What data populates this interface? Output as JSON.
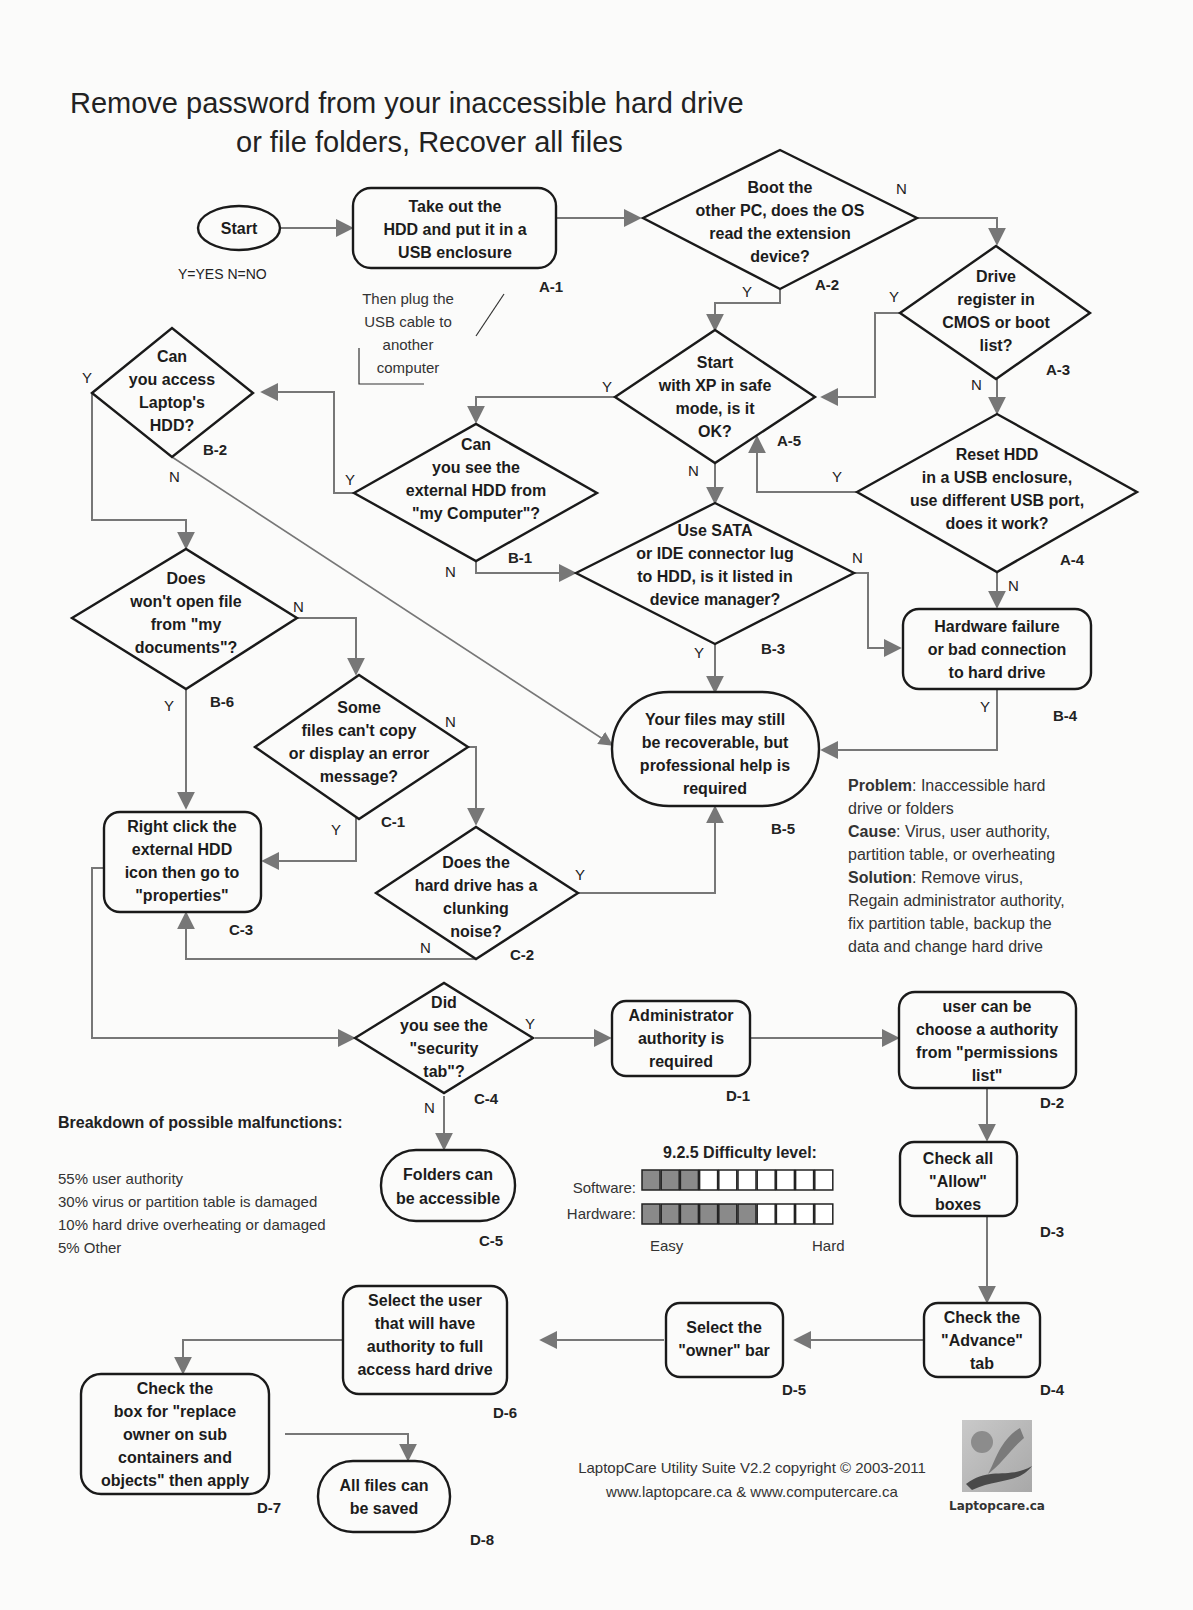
{
  "title": {
    "line1": "Remove password from your inaccessible hard drive",
    "line2": "or file folders, Recover all files"
  },
  "legend": {
    "yes_no": "Y=YES N=NO"
  },
  "nodes": {
    "start": {
      "id": "",
      "lines": [
        "Start"
      ]
    },
    "A1": {
      "id": "A-1",
      "lines": [
        "Take out the",
        "HDD and put it in a",
        "USB enclosure"
      ]
    },
    "A1_note": {
      "lines": [
        "Then plug the",
        "USB cable to",
        "another",
        "computer"
      ]
    },
    "A2": {
      "id": "A-2",
      "lines": [
        "Boot the",
        "other PC, does the OS",
        "read the extension",
        "device?"
      ]
    },
    "A3": {
      "id": "A-3",
      "lines": [
        "Drive",
        "register in",
        "CMOS or boot",
        "list?"
      ]
    },
    "A4": {
      "id": "A-4",
      "lines": [
        "Reset HDD",
        "in a USB enclosure,",
        "use different USB port,",
        "does it work?"
      ]
    },
    "A5": {
      "id": "A-5",
      "lines": [
        "Start",
        "with XP in safe",
        "mode, is it",
        "OK?"
      ]
    },
    "B1": {
      "id": "B-1",
      "lines": [
        "Can",
        "you see the",
        "external HDD from",
        "\"my Computer\"?"
      ]
    },
    "B2": {
      "id": "B-2",
      "lines": [
        "Can",
        "you access",
        "Laptop's",
        "HDD?"
      ]
    },
    "B3": {
      "id": "B-3",
      "lines": [
        "Use SATA",
        "or IDE connector lug",
        "to HDD, is it listed in",
        "device manager?"
      ]
    },
    "B4": {
      "id": "B-4",
      "lines": [
        "Hardware failure",
        "or bad connection",
        "to hard drive"
      ]
    },
    "B5": {
      "id": "B-5",
      "lines": [
        "Your files may still",
        "be recoverable, but",
        "professional help is",
        "required"
      ]
    },
    "B6": {
      "id": "B-6",
      "lines": [
        "Does",
        "won't open file",
        "from \"my",
        "documents\"?"
      ]
    },
    "C1": {
      "id": "C-1",
      "lines": [
        "Some",
        "files can't copy",
        "or display an error",
        "message?"
      ]
    },
    "C2": {
      "id": "C-2",
      "lines": [
        "Does the",
        "hard drive has a",
        "clunking",
        "noise?"
      ]
    },
    "C3": {
      "id": "C-3",
      "lines": [
        "Right click the",
        "external HDD",
        "icon then go to",
        "\"properties\""
      ]
    },
    "C4": {
      "id": "C-4",
      "lines": [
        "Did",
        "you see the",
        "\"security",
        "tab\"?"
      ]
    },
    "C5": {
      "id": "C-5",
      "lines": [
        "Folders can",
        "be accessible"
      ]
    },
    "D1": {
      "id": "D-1",
      "lines": [
        "Administrator",
        "authority is",
        "required"
      ]
    },
    "D2": {
      "id": "D-2",
      "lines": [
        "user can be",
        "choose a authority",
        "from \"permissions",
        "list\""
      ]
    },
    "D3": {
      "id": "D-3",
      "lines": [
        "Check all",
        "\"Allow\"",
        "boxes"
      ]
    },
    "D4": {
      "id": "D-4",
      "lines": [
        "Check the",
        "\"Advance\"",
        "tab"
      ]
    },
    "D5": {
      "id": "D-5",
      "lines": [
        "Select the",
        "\"owner\" bar"
      ]
    },
    "D6": {
      "id": "D-6",
      "lines": [
        "Select the user",
        "that will have",
        "authority to full",
        "access hard drive"
      ]
    },
    "D7": {
      "id": "D-7",
      "lines": [
        "Check the",
        "box for \"replace",
        "owner on sub",
        "containers and",
        "objects\" then apply"
      ]
    },
    "D8": {
      "id": "D-8",
      "lines": [
        "All files can",
        "be saved"
      ]
    }
  },
  "edge_labels": {
    "yes": "Y",
    "no": "N"
  },
  "summary": {
    "problem_label": "Problem",
    "problem_text": ": Inaccessible hard",
    "problem_text2": "drive or folders",
    "cause_label": "Cause",
    "cause_text": ": Virus, user authority,",
    "cause_text2": "partition table, or overheating",
    "solution_label": "Solution",
    "solution_text": ": Remove virus,",
    "solution_text2": "Regain administrator authority,",
    "solution_text3": "fix partition table, backup the",
    "solution_text4": "data and change hard drive"
  },
  "breakdown": {
    "heading": "Breakdown of possible malfunctions:",
    "items": [
      "55% user authority",
      "30% virus or partition table is damaged",
      "10% hard drive overheating or damaged",
      "5%   Other"
    ]
  },
  "difficulty": {
    "heading": "9.2.5 Difficulty level:",
    "software_label": "Software:",
    "software_level": 3,
    "hardware_label": "Hardware:",
    "hardware_level": 6,
    "max_level": 10,
    "easy_label": "Easy",
    "hard_label": "Hard"
  },
  "footer": {
    "line1": "LaptopCare Utility Suite V2.2 copyright © 2003-2011",
    "line2": "www.laptopcare.ca & www.computercare.ca",
    "logo_caption": "Laptopcare.ca"
  },
  "colors": {
    "connector": "#777777",
    "shape_stroke": "#1a1a1a",
    "difficulty_fill": "#8a8a8a",
    "background": "#fbfbfa"
  }
}
